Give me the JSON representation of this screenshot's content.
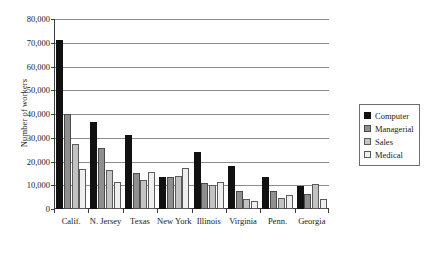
{
  "chart_data": {
    "type": "bar",
    "title": "",
    "xlabel": "",
    "ylabel": "Number of workers",
    "ylim": [
      0,
      80000
    ],
    "ytick_values": [
      0,
      10000,
      20000,
      30000,
      40000,
      50000,
      60000,
      70000,
      80000
    ],
    "ytick_labels": [
      "0",
      "10,000",
      "20,000",
      "30,000",
      "40,000",
      "50,000",
      "60,000",
      "70,000",
      "80,000"
    ],
    "grid": true,
    "legend_position": "right",
    "categories": [
      "Calif.",
      "N. Jersey",
      "Texas",
      "New York",
      "Illinois",
      "Virginia",
      "Penn.",
      "Georgia"
    ],
    "series": [
      {
        "name": "Computer",
        "color": "#111111",
        "values": [
          71000,
          36800,
          31000,
          13300,
          24000,
          18200,
          13400,
          9900
        ]
      },
      {
        "name": "Managerial",
        "color": "#8f8f8f",
        "values": [
          40000,
          25800,
          15300,
          13300,
          10800,
          7600,
          7400,
          6200
        ]
      },
      {
        "name": "Sales",
        "color": "#c3c3c3",
        "values": [
          27400,
          16400,
          12200,
          14000,
          10000,
          4200,
          4600,
          10600
        ]
      },
      {
        "name": "Medical",
        "color": "#efefef",
        "values": [
          17000,
          11500,
          15700,
          17400,
          11300,
          3300,
          5900,
          4300
        ]
      }
    ]
  },
  "legend": {
    "entries": [
      {
        "label": "Computer"
      },
      {
        "label": "Managerial"
      },
      {
        "label": "Sales"
      },
      {
        "label": "Medical"
      }
    ]
  },
  "caption": {
    "clipped_line": "                    "
  }
}
